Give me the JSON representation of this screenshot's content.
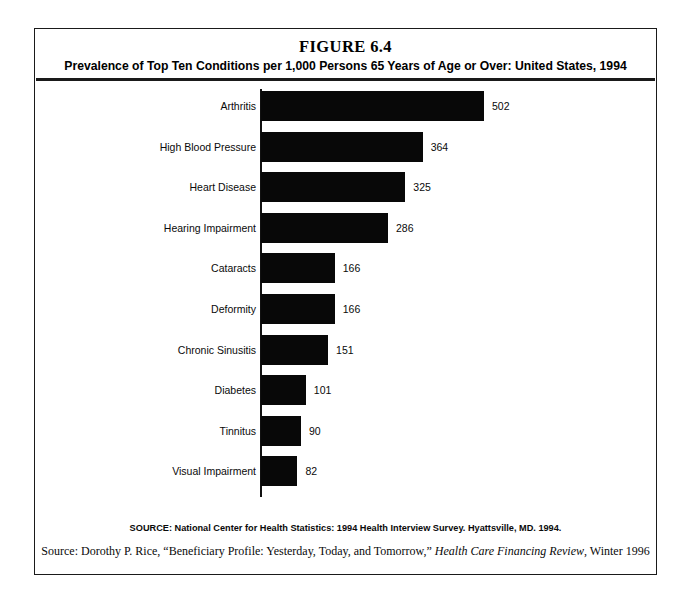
{
  "figure": {
    "title": "FIGURE 6.4",
    "subtitle": "Prevalence of Top Ten Conditions per 1,000 Persons 65 Years of Age or Over: United States, 1994",
    "source_note": "SOURCE: National Center for Health Statistics: 1994 Health Interview Survey. Hyattsville, MD. 1994.",
    "citation": {
      "prefix": "Source: Dorothy P. Rice, “Beneficiary Profile: Yesterday, Today, and Tomorrow,” ",
      "journal": "Health Care Financing Review",
      "suffix": ", Winter 1996"
    }
  },
  "chart_data": {
    "type": "bar",
    "orientation": "horizontal",
    "title": "FIGURE 6.4",
    "subtitle": "Prevalence of Top Ten Conditions per 1,000 Persons 65 Years of Age or Over: United States, 1994",
    "xlabel": "",
    "ylabel": "",
    "xlim": [
      0,
      502
    ],
    "grid": false,
    "legend": false,
    "bar_color": "#080808",
    "axis_color": "#111111",
    "data_labels": true,
    "categories": [
      "Arthritis",
      "High Blood Pressure",
      "Heart Disease",
      "Hearing Impairment",
      "Cataracts",
      "Deformity",
      "Chronic Sinusitis",
      "Diabetes",
      "Tinnitus",
      "Visual Impairment"
    ],
    "values": [
      502,
      364,
      325,
      286,
      166,
      166,
      151,
      101,
      90,
      82
    ],
    "bars": [
      {
        "label": "Arthritis",
        "value": 502
      },
      {
        "label": "High Blood Pressure",
        "value": 364
      },
      {
        "label": "Heart Disease",
        "value": 325
      },
      {
        "label": "Hearing Impairment",
        "value": 286
      },
      {
        "label": "Cataracts",
        "value": 166
      },
      {
        "label": "Deformity",
        "value": 166
      },
      {
        "label": "Chronic Sinusitis",
        "value": 151
      },
      {
        "label": "Diabetes",
        "value": 101
      },
      {
        "label": "Tinnitus",
        "value": 90
      },
      {
        "label": "Visual Impairment",
        "value": 82
      }
    ],
    "units": "cases per 1,000 persons",
    "scale_px_per_unit": 0.4442
  }
}
